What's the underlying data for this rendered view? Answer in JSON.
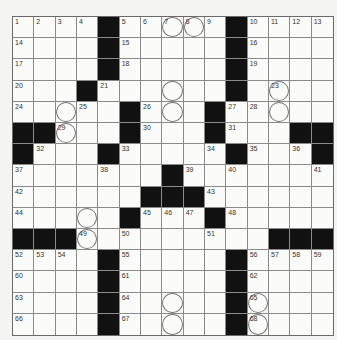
{
  "puzzle": {
    "size": 15,
    "grid": [
      "....#.....#....",
      "....#.....#....",
      "....#.....#....",
      "...#......#....",
      ".....#...#.....",
      "##...#...#...##",
      "#...#.....#...#",
      ".......#.......",
      "......###......",
      ".....#...#.....",
      "###.........###",
      "....#.....#....",
      "....#.....#....",
      "....#.....#....",
      "....#.....#...."
    ],
    "numbers": {
      "0,0": "1",
      "0,1": "2",
      "0,2": "3",
      "0,3": "4",
      "0,5": "5",
      "0,6": "6",
      "0,7": "7",
      "0,8": "8",
      "0,9": "9",
      "0,11": "10",
      "0,12": "11",
      "0,13": "12",
      "0,14": "13",
      "1,0": "14",
      "1,5": "15",
      "1,11": "16",
      "2,0": "17",
      "2,5": "18",
      "2,11": "19",
      "3,0": "20",
      "3,4": "21",
      "3,10": "22",
      "3,12": "23",
      "4,0": "24",
      "4,3": "25",
      "4,6": "26",
      "4,10": "27",
      "4,11": "28",
      "5,2": "29",
      "5,6": "30",
      "5,10": "31",
      "6,1": "32",
      "6,5": "33",
      "6,9": "34",
      "6,11": "35",
      "6,13": "36",
      "7,0": "37",
      "7,4": "38",
      "7,8": "39",
      "7,10": "40",
      "7,14": "41",
      "8,0": "42",
      "8,9": "43",
      "9,0": "44",
      "9,6": "45",
      "9,7": "46",
      "9,8": "47",
      "9,10": "48",
      "10,3": "49",
      "10,5": "50",
      "10,9": "51",
      "11,0": "52",
      "11,1": "53",
      "11,2": "54",
      "11,5": "55",
      "11,11": "56",
      "11,12": "57",
      "11,13": "58",
      "11,14": "59",
      "12,0": "60",
      "12,5": "61",
      "12,11": "62",
      "13,0": "63",
      "13,5": "64",
      "13,11": "65",
      "14,0": "66",
      "14,5": "67",
      "14,11": "68"
    },
    "circles": [
      "0,7",
      "0,8",
      "3,7",
      "3,12",
      "4,2",
      "4,7",
      "4,12",
      "5,2",
      "9,3",
      "10,3",
      "13,7",
      "13,11",
      "14,7",
      "14,11"
    ],
    "colors": {
      "black": "#111111",
      "white": "#fbfbfa",
      "line": "#8a8a8a"
    }
  }
}
